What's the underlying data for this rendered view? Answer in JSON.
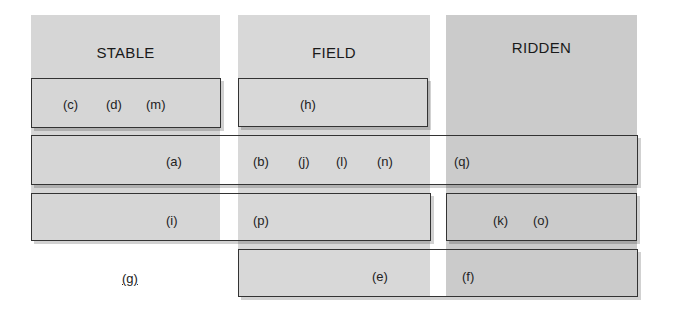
{
  "columns": [
    {
      "id": "stable",
      "title": "STABLE"
    },
    {
      "id": "field",
      "title": "FIELD"
    },
    {
      "id": "ridden",
      "title": "RIDDEN"
    }
  ],
  "boxes": {
    "stable_box": [
      "(c)",
      "(d)",
      "(m)"
    ],
    "field_box": [
      "(h)"
    ],
    "row_a": [
      "(a)",
      "(b)",
      "(j)",
      "(l)",
      "(n)",
      "(q)"
    ],
    "row_i": [
      "(i)",
      "(p)"
    ],
    "ridden_box": [
      "(k)",
      "(o)"
    ],
    "row_e": [
      "(e)",
      "(f)"
    ]
  },
  "standalone": {
    "g": "(g)"
  },
  "colors": {
    "stable_bg": "#d6d6d6",
    "field_bg": "#d8d8d8",
    "ridden_bg": "#cbcbcb",
    "border": "#333333"
  }
}
